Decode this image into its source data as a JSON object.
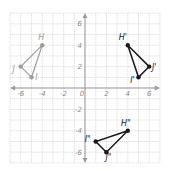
{
  "diagram": {
    "type": "coordinate-grid-transformations",
    "grid": {
      "x_range": [
        -7,
        7
      ],
      "y_range": [
        -7,
        7
      ],
      "x_tick_labels": [
        "-6",
        "-4",
        "-2",
        "0",
        "2",
        "4",
        "6"
      ],
      "y_tick_labels": [
        "6",
        "4",
        "2",
        "-2",
        "-4",
        "-6"
      ],
      "grid_color": "#c8c8c8",
      "axis_color": "#9a9a9a"
    },
    "figures": [
      {
        "name": "original",
        "color": "#9e9e9e",
        "vertices": [
          {
            "label": "H",
            "x": -4,
            "y": 4
          },
          {
            "label": "I",
            "x": -5,
            "y": 1
          },
          {
            "label": "J",
            "x": -6,
            "y": 2
          }
        ]
      },
      {
        "name": "image-1",
        "color": "#1a1a1a",
        "vertices": [
          {
            "label": "H'",
            "x": 4,
            "y": 4
          },
          {
            "label": "I'",
            "x": 5,
            "y": 1
          },
          {
            "label": "J'",
            "x": 6,
            "y": 2
          }
        ]
      },
      {
        "name": "image-2",
        "color": "#1a1a1a",
        "vertices": [
          {
            "label": "H\"",
            "x": 4,
            "y": -4
          },
          {
            "label": "I\"",
            "x": 1,
            "y": -5
          },
          {
            "label": "J\"",
            "x": 2,
            "y": -6
          }
        ]
      }
    ]
  }
}
